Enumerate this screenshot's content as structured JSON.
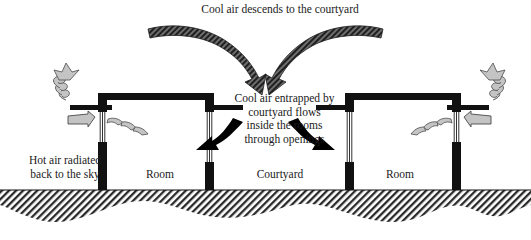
{
  "diagram": {
    "labels": {
      "top_caption": "Cool air descends to the courtyard",
      "center_caption": "Cool air entrapped by\ncourtyard flows\ninside the rooms\nthrough openings",
      "left_caption": "Hot air radiated\nback to the sky",
      "room_left": "Room",
      "courtyard": "Courtyard",
      "room_right": "Room"
    },
    "colors": {
      "structure": "#111111",
      "ground_hatch": "#2a2a2a",
      "cool_arrow": "#3a3a3a",
      "hot_arrow": "#b9b9b9",
      "hot_arrow_outline": "#4a4a4a",
      "flow_arrow": "#000000",
      "background": "#ffffff",
      "text": "#1a1a1a"
    },
    "elements": {
      "descending_arrow_left": "cool-air-arrow-left",
      "descending_arrow_right": "cool-air-arrow-right",
      "courtyard_flow_arrow_left": "courtyard-flow-arrow-left",
      "courtyard_flow_arrow_right": "courtyard-flow-arrow-right",
      "radiation_spiral_left": "hot-air-spiral-left",
      "radiation_spiral_right": "hot-air-spiral-right",
      "exhaust_arrow_left": "hot-air-exhaust-arrow-left",
      "exhaust_arrow_right": "hot-air-exhaust-arrow-right",
      "ground": "ground-hatching",
      "building_left": "building-left",
      "building_right": "building-right"
    }
  }
}
